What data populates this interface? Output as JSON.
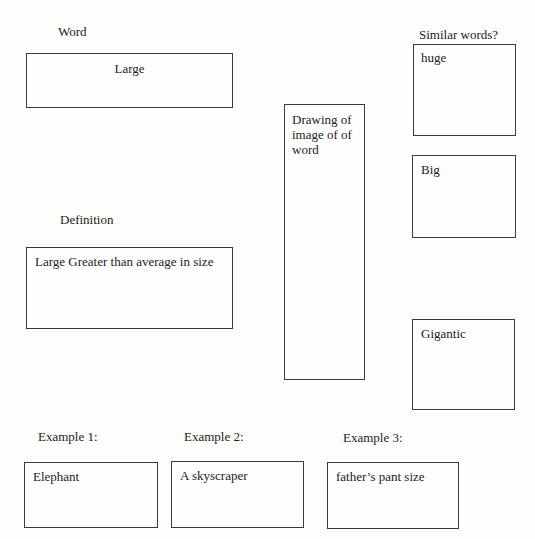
{
  "word": {
    "label": "Word",
    "value": "Large"
  },
  "definition": {
    "label": "Definition",
    "value": "Large Greater than average in size"
  },
  "drawing": {
    "value": "Drawing of image of of word"
  },
  "similar": {
    "label": "Similar words?",
    "items": [
      "huge",
      "Big",
      "Gigantic"
    ]
  },
  "examples": [
    {
      "label": "Example 1:",
      "value": "Elephant"
    },
    {
      "label": "Example 2:",
      "value": "A skyscraper"
    },
    {
      "label": "Example 3:",
      "value": "father’s pant size"
    }
  ]
}
